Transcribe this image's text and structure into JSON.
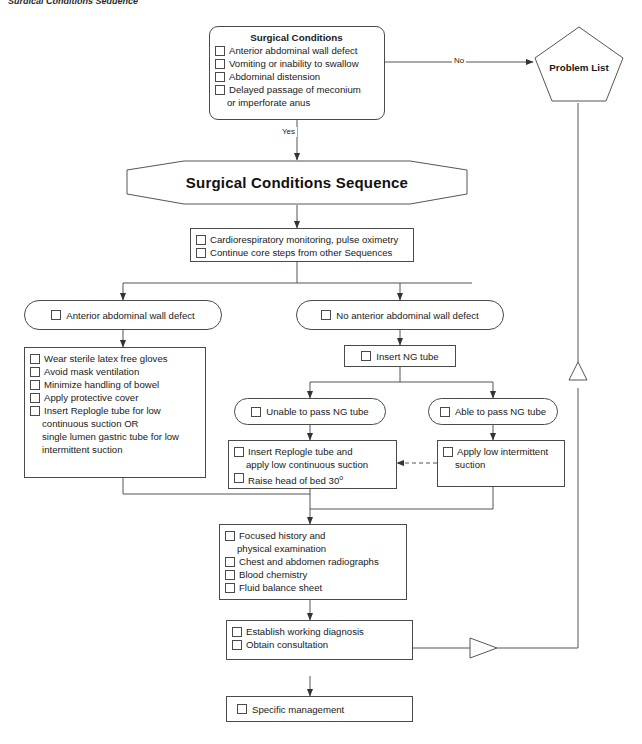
{
  "page": {
    "top_crumb": "Surgical Conditions Sequence",
    "stroke_color": "#4a4a4a",
    "text_color": "#1a1a1a",
    "background": "#ffffff"
  },
  "nodes": {
    "surgical_conditions": {
      "title": "Surgical Conditions",
      "items": [
        "Anterior abdominal wall defect",
        "Vomiting or inability to swallow",
        "Abdominal distension",
        "Delayed passage of meconium"
      ],
      "continuation": "or imperforate anus"
    },
    "problem_list": {
      "label": "Problem List"
    },
    "sequence_banner": {
      "label": "Surgical Conditions Sequence"
    },
    "monitoring": {
      "items": [
        "Cardiorespiratory monitoring, pulse oximetry",
        "Continue core steps from other Sequences"
      ]
    },
    "anterior_defect": {
      "label": "Anterior abdominal wall defect"
    },
    "no_anterior_defect": {
      "label": "No anterior abdominal wall defect"
    },
    "anterior_care": {
      "items": [
        "Wear sterile latex free gloves",
        "Avoid mask ventilation",
        "Minimize handling of bowel",
        "Apply protective cover",
        "Insert Replogle tube for low"
      ],
      "continuations": [
        "continuous suction OR",
        "single lumen gastric tube for low",
        "intermittent suction"
      ]
    },
    "insert_ng": {
      "label": "Insert NG tube"
    },
    "unable_pass": {
      "label": "Unable to pass NG tube"
    },
    "able_pass": {
      "label": "Able to pass NG tube"
    },
    "replogle": {
      "items": [
        "Insert Replogle tube and",
        "Raise head of bed 30"
      ],
      "continuation": "apply low continuous suction",
      "degree_suffix": "o"
    },
    "intermittent": {
      "items": [
        "Apply low intermittent"
      ],
      "continuation": "suction"
    },
    "workup": {
      "items": [
        "Focused history and",
        "Chest and abdomen radiographs",
        "Blood chemistry",
        "Fluid balance sheet"
      ],
      "continuation": "physical examination"
    },
    "diagnosis": {
      "items": [
        "Establish working diagnosis",
        "Obtain consultation"
      ]
    },
    "specific_management": {
      "label": "Specific management"
    }
  },
  "edges": {
    "no_label": "No",
    "yes_label": "Yes"
  }
}
